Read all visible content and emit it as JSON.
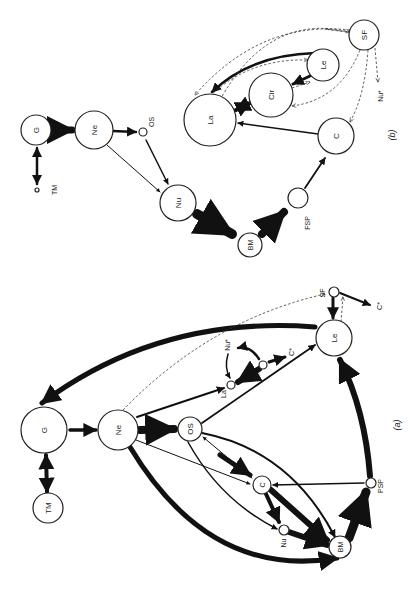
{
  "figure": {
    "panels": [
      {
        "id": "b",
        "label": "(b)",
        "nodes": [
          {
            "id": "G",
            "label": "G",
            "x": 36,
            "y": 130,
            "r": 15
          },
          {
            "id": "Ne",
            "label": "Ne",
            "x": 94,
            "y": 130,
            "r": 19
          },
          {
            "id": "OS",
            "label": "OS",
            "x": 143,
            "y": 132,
            "r": 4
          },
          {
            "id": "TM",
            "label": "TM",
            "x": 37,
            "y": 190,
            "r": 2
          },
          {
            "id": "Nu",
            "label": "Nu",
            "x": 178,
            "y": 203,
            "r": 18
          },
          {
            "id": "BM",
            "label": "BM",
            "x": 250,
            "y": 245,
            "r": 12
          },
          {
            "id": "FSP",
            "label": "FSP",
            "x": 298,
            "y": 198,
            "r": 10
          },
          {
            "id": "C",
            "label": "C",
            "x": 336,
            "y": 136,
            "r": 18
          },
          {
            "id": "La",
            "label": "La",
            "x": 210,
            "y": 120,
            "r": 26
          },
          {
            "id": "Cir",
            "label": "Cir",
            "x": 271,
            "y": 95,
            "r": 22
          },
          {
            "id": "Le",
            "label": "Le",
            "x": 323,
            "y": 65,
            "r": 16
          },
          {
            "id": "SF",
            "label": "SF",
            "x": 364,
            "y": 35,
            "r": 15
          },
          {
            "id": "NuStar",
            "label": "Nu*",
            "x": 381,
            "y": 93,
            "r": 0
          }
        ]
      },
      {
        "id": "a",
        "label": "(a)",
        "nodes": [
          {
            "id": "G",
            "label": "G",
            "x": 44,
            "y": 430,
            "r": 23
          },
          {
            "id": "TM",
            "label": "TM",
            "x": 48,
            "y": 508,
            "r": 15
          },
          {
            "id": "Ne",
            "label": "Ne",
            "x": 118,
            "y": 430,
            "r": 20
          },
          {
            "id": "OS",
            "label": "OS",
            "x": 190,
            "y": 429,
            "r": 12
          },
          {
            "id": "La",
            "label": "La",
            "x": 230,
            "y": 385,
            "r": 4
          },
          {
            "id": "Cir",
            "label": "Cir",
            "x": 263,
            "y": 365,
            "r": 4
          },
          {
            "id": "NuStar",
            "label": "Nu*",
            "x": 242,
            "y": 347,
            "r": 0
          },
          {
            "id": "CStar1",
            "label": "C*",
            "x": 290,
            "y": 355,
            "r": 0
          },
          {
            "id": "Le",
            "label": "Le",
            "x": 334,
            "y": 338,
            "r": 18
          },
          {
            "id": "SF",
            "label": "SF",
            "x": 333,
            "y": 292,
            "r": 5
          },
          {
            "id": "CStar2",
            "label": "C*",
            "x": 381,
            "y": 312,
            "r": 0
          },
          {
            "id": "C",
            "label": "C",
            "x": 262,
            "y": 485,
            "r": 9
          },
          {
            "id": "Nu",
            "label": "Nu",
            "x": 283,
            "y": 530,
            "r": 6
          },
          {
            "id": "BM",
            "label": "BM",
            "x": 340,
            "y": 547,
            "r": 11
          },
          {
            "id": "PSP",
            "label": "PSP",
            "x": 370,
            "y": 483,
            "r": 6
          }
        ]
      }
    ],
    "labels": {
      "b_G": "G",
      "b_Ne": "Ne",
      "b_OS": "OS",
      "b_TM": "TM",
      "b_Nu": "Nu",
      "b_BM": "BM",
      "b_FSP": "FSP",
      "b_C": "C",
      "b_La": "La",
      "b_Cir": "Cir",
      "b_Le": "Le",
      "b_SF": "SF",
      "b_NuStar": "Nu*",
      "b_panel": "(b)",
      "a_G": "G",
      "a_TM": "TM",
      "a_Ne": "Ne",
      "a_OS": "OS",
      "a_La": "La",
      "a_Cir": "Cir",
      "a_NuStar": "Nu*",
      "a_CStar1": "C*",
      "a_Le": "Le",
      "a_SF": "SF",
      "a_CStar2": "C*",
      "a_C": "C",
      "a_Nu": "Nu",
      "a_BM": "BM",
      "a_PSP": "PSP",
      "a_panel": "(a)"
    },
    "colors": {
      "ink": "#111111",
      "background": "#ffffff"
    }
  }
}
